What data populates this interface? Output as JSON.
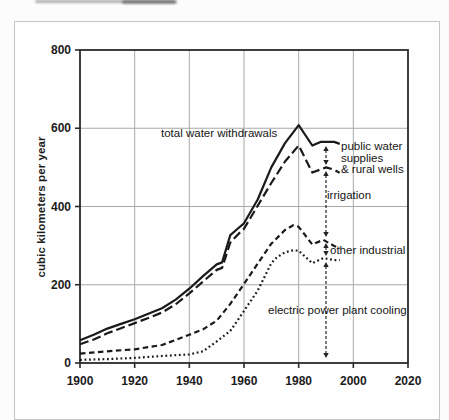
{
  "figure": {
    "bg": "#fcfcfc",
    "panel_bg": "#fefefe",
    "panel_border_color": "#c5c5c5",
    "text_color": "#1c1c1c",
    "grid_color": "#a9a9a9",
    "axis_color": "#2a2a2a",
    "line_color": "#1a1a1a",
    "has_cropped_text_remnant_top": true
  },
  "chart_data": {
    "type": "line",
    "title": "",
    "xlabel": "",
    "ylabel": "cubic kilometers per year",
    "xlim": [
      1900,
      2020
    ],
    "ylim": [
      0,
      800
    ],
    "x_ticks": [
      1900,
      1920,
      1940,
      1960,
      1980,
      2000,
      2020
    ],
    "y_ticks": [
      0,
      200,
      400,
      600,
      800
    ],
    "grid": true,
    "legend_position": "none (inline annotations with arrow markers at ~1990)",
    "series": [
      {
        "name": "total water withdrawals",
        "line_style": "solid",
        "x": [
          1900,
          1905,
          1910,
          1915,
          1920,
          1925,
          1930,
          1935,
          1940,
          1945,
          1950,
          1952,
          1955,
          1958,
          1960,
          1965,
          1970,
          1975,
          1980,
          1985,
          1988,
          1993,
          1995
        ],
        "values": [
          58,
          72,
          88,
          100,
          112,
          126,
          140,
          162,
          190,
          222,
          252,
          257,
          327,
          345,
          357,
          418,
          500,
          562,
          608,
          556,
          565,
          565,
          560
        ]
      },
      {
        "name": "irrigation + other industrial + electric power plant cooling (total minus public water supplies & rural wells)",
        "line_style": "long-dash",
        "x": [
          1900,
          1905,
          1910,
          1915,
          1920,
          1925,
          1930,
          1935,
          1940,
          1945,
          1950,
          1952,
          1955,
          1958,
          1960,
          1965,
          1970,
          1975,
          1980,
          1985,
          1990,
          1993,
          1995
        ],
        "values": [
          48,
          60,
          76,
          89,
          102,
          115,
          129,
          150,
          178,
          208,
          238,
          243,
          308,
          330,
          343,
          402,
          460,
          515,
          556,
          487,
          500,
          494,
          486
        ]
      },
      {
        "name": "other industrial + electric power plant cooling",
        "line_style": "medium-dash",
        "x": [
          1900,
          1910,
          1920,
          1930,
          1940,
          1945,
          1950,
          1955,
          1960,
          1965,
          1970,
          1975,
          1978,
          1980,
          1985,
          1989,
          1993,
          1995
        ],
        "values": [
          24,
          30,
          35,
          46,
          72,
          86,
          108,
          151,
          202,
          254,
          305,
          340,
          352,
          348,
          303,
          315,
          299,
          293
        ]
      },
      {
        "name": "electric power plant cooling",
        "line_style": "dotted",
        "x": [
          1900,
          1910,
          1920,
          1930,
          1940,
          1945,
          1950,
          1955,
          1960,
          1965,
          1970,
          1972,
          1975,
          1978,
          1980,
          1985,
          1989,
          1993,
          1995
        ],
        "values": [
          8,
          10,
          13,
          18,
          22,
          30,
          55,
          82,
          133,
          185,
          255,
          270,
          283,
          288,
          287,
          255,
          268,
          263,
          263
        ]
      }
    ],
    "band_meaning": [
      "gap between curve 1 and 2 = public water supplies & rural wells",
      "gap between curve 2 and 3 = irrigation",
      "gap between curve 3 and 4 = other industrial",
      "area below curve 4 = electric power plant cooling"
    ],
    "annotations": [
      {
        "id": "total",
        "text": "total water withdrawals",
        "x": 161,
        "y": 128
      },
      {
        "id": "public",
        "lines": [
          "public water",
          "supplies",
          "& rural wells"
        ],
        "x": 341,
        "y": 141
      },
      {
        "id": "irrigation",
        "text": "irrigation",
        "x": 327,
        "y": 190
      },
      {
        "id": "other-industrial",
        "text": "other industrial",
        "x": 330,
        "y": 245
      },
      {
        "id": "electric",
        "text": "electric power plant cooling",
        "x": 268,
        "y": 305
      }
    ],
    "marker_arrow": {
      "x_px": 326,
      "x_year": 1990,
      "segments_px": [
        [
          146,
          165
        ],
        [
          171,
          237
        ],
        [
          243,
          256
        ],
        [
          262,
          358
        ]
      ]
    },
    "plot_box_px": {
      "left": 80,
      "top": 50,
      "right": 408,
      "bottom": 363
    }
  }
}
